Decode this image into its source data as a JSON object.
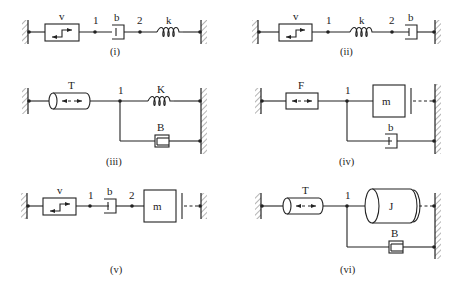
{
  "figure": {
    "panels": [
      {
        "caption": "(i)",
        "elements": [
          "ground",
          "velocity-source",
          "node",
          "damper",
          "node",
          "spring",
          "ground"
        ],
        "labels": {
          "source": "v",
          "node1": "1",
          "damper": "b",
          "node2": "2",
          "spring": "k"
        }
      },
      {
        "caption": "(ii)",
        "elements": [
          "ground",
          "velocity-source",
          "node",
          "spring",
          "node",
          "damper",
          "ground"
        ],
        "labels": {
          "source": "v",
          "node1": "1",
          "spring": "k",
          "node2": "2",
          "damper": "b"
        }
      },
      {
        "caption": "(iii)",
        "elements": [
          "ground",
          "torque-source",
          "node",
          "spring",
          "damper",
          "ground"
        ],
        "labels": {
          "source": "T",
          "node1": "1",
          "spring": "K",
          "damper": "B"
        }
      },
      {
        "caption": "(iv)",
        "elements": [
          "ground",
          "force-source",
          "node",
          "mass",
          "damper",
          "ground"
        ],
        "labels": {
          "source": "F",
          "node1": "1",
          "mass": "m",
          "damper": "b"
        }
      },
      {
        "caption": "(v)",
        "elements": [
          "ground",
          "velocity-source",
          "node",
          "damper",
          "node",
          "mass",
          "ground"
        ],
        "labels": {
          "source": "v",
          "node1": "1",
          "damper": "b",
          "node2": "2",
          "mass": "m"
        }
      },
      {
        "caption": "(vi)",
        "elements": [
          "ground",
          "torque-source",
          "node",
          "inertia",
          "damper",
          "ground"
        ],
        "labels": {
          "source": "T",
          "node1": "1",
          "inertia": "J",
          "damper": "B"
        }
      }
    ]
  }
}
